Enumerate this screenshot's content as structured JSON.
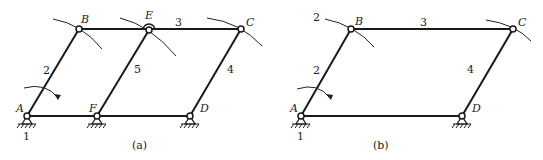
{
  "figures": [
    {
      "id": "a",
      "caption": "(a)",
      "joints": {
        "A": {
          "label": "A",
          "x": 27,
          "y": 116,
          "ground": true
        },
        "B": {
          "label": "B",
          "x": 79,
          "y": 29
        },
        "E": {
          "label": "E",
          "x": 149,
          "y": 30
        },
        "C": {
          "label": "C",
          "x": 241,
          "y": 29
        },
        "F": {
          "label": "F",
          "x": 97,
          "y": 116,
          "ground": true
        },
        "D": {
          "label": "D",
          "x": 190,
          "y": 116,
          "ground": true
        }
      },
      "link_labels": {
        "frame": "1",
        "AB": "2",
        "BC": "3",
        "CD": "4",
        "EF": "5"
      }
    },
    {
      "id": "b",
      "caption": "(b)",
      "joints": {
        "A": {
          "label": "A",
          "x": 301,
          "y": 116,
          "ground": true
        },
        "B": {
          "label": "B",
          "x": 351,
          "y": 29
        },
        "C": {
          "label": "C",
          "x": 513,
          "y": 29
        },
        "D": {
          "label": "D",
          "x": 462,
          "y": 116,
          "ground": true
        }
      },
      "link_labels": {
        "frame": "1",
        "AB": "2",
        "AB_top": "2",
        "BC": "3",
        "CD": "4"
      }
    }
  ]
}
